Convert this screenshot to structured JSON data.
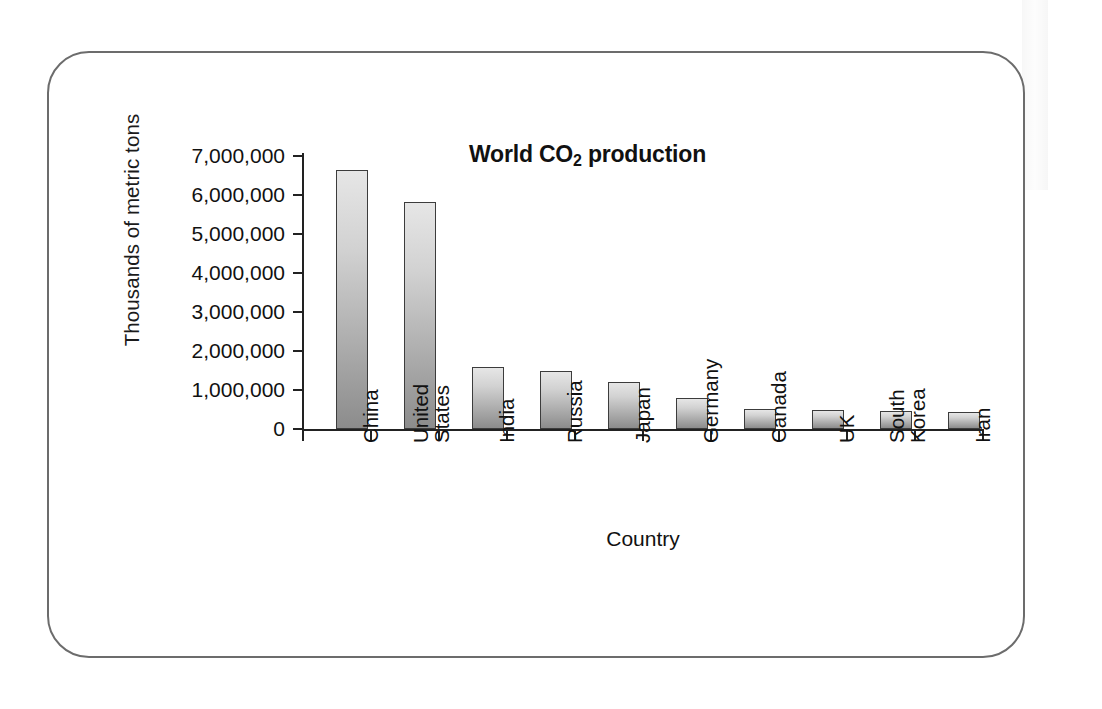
{
  "figure": {
    "frame_border_color": "#6c6c6c",
    "background_color": "#ffffff"
  },
  "chart_data": {
    "type": "bar",
    "title": "World CO2 production",
    "title_prefix": "World CO",
    "title_subscript": "2",
    "title_suffix": " production",
    "xlabel": "Country",
    "ylabel": "Thousands of metric tons",
    "categories": [
      "China",
      "United States",
      "India",
      "Russia",
      "Japan",
      "Germany",
      "Canada",
      "UK",
      "South Korea",
      "Iran"
    ],
    "category_lines": [
      [
        "China"
      ],
      [
        "United",
        "States"
      ],
      [
        "India"
      ],
      [
        "Russia"
      ],
      [
        "Japan"
      ],
      [
        "Germany"
      ],
      [
        "Canada"
      ],
      [
        "UK"
      ],
      [
        "South",
        "Korea"
      ],
      [
        "Iran"
      ]
    ],
    "values": [
      6640000,
      5830000,
      1590000,
      1490000,
      1210000,
      800000,
      520000,
      500000,
      460000,
      430000
    ],
    "ylim": [
      0,
      7000000
    ],
    "ytick_values": [
      0,
      1000000,
      2000000,
      3000000,
      4000000,
      5000000,
      6000000,
      7000000
    ],
    "ytick_labels": [
      "0",
      "1,000,000",
      "2,000,000",
      "3,000,000",
      "4,000,000",
      "5,000,000",
      "6,000,000",
      "7,000,000"
    ],
    "grid": false,
    "legend": false,
    "bar_fill_top_color": "#e6e6e6",
    "bar_fill_bottom_color": "#8c8c8c",
    "bar_edge_color": "#3c3c3c",
    "xtick_label_rotation": 90
  }
}
